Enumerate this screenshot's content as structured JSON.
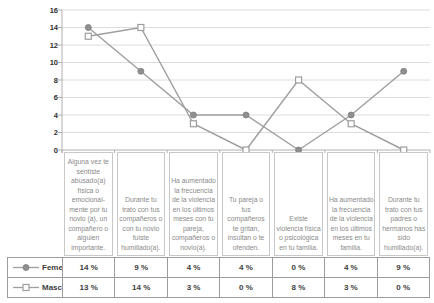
{
  "colors": {
    "line": "#9e9e9e",
    "marker_fill": "#8f8f8f",
    "marker_stroke": "#7f7f7f",
    "marker_open_fill": "#ffffff",
    "grid": "#dcdcdc",
    "axis": "#b0b0b0",
    "category_border": "#c8c8c8",
    "category_text": "#8a8a8a",
    "table_border": "#9c9c9c",
    "table_text": "#3d3d3d",
    "ytick_text": "#2e2e2e"
  },
  "chart_data": {
    "type": "line",
    "title": "",
    "xlabel": "",
    "ylabel": "",
    "categories": [
      "Alguna vez te sentiste abusado(a) física o emocional- mente por tu novio (a), un compañero o alguien importante.",
      "Durante tu trato con tus compañeros o con tu novio fuiste humillado(a).",
      "Ha aumentado la frecuencia de la violencia en los últimos meses con tu pareja, compañeros o novio(a).",
      "Tu pareja o tus compañeros te gritan, insultan o te ofenden.",
      "Existe violencia física o psicológica en tu familia.",
      "Ha aumentado la frecuencia de la violencia en los últimos meses en tu familia.",
      "Durante tu trato con tus padres o hermanos has sido humillado(a)."
    ],
    "series": [
      {
        "name": "Femenino",
        "marker": "filled-circle",
        "values": [
          14,
          9,
          4,
          4,
          0,
          4,
          9
        ],
        "display_values": [
          "14 %",
          "9 %",
          "4 %",
          "4 %",
          "0 %",
          "4 %",
          "9 %"
        ]
      },
      {
        "name": "Masculino",
        "marker": "open-square",
        "values": [
          13,
          14,
          3,
          0,
          8,
          3,
          0
        ],
        "display_values": [
          "13 %",
          "14 %",
          "3 %",
          "0 %",
          "8 %",
          "3 %",
          "0 %"
        ]
      }
    ],
    "ylim": [
      0,
      16
    ],
    "yticks": [
      0,
      2,
      4,
      6,
      8,
      10,
      12,
      14,
      16
    ],
    "grid": "horizontal",
    "legend_position": "table-bottom-left"
  }
}
